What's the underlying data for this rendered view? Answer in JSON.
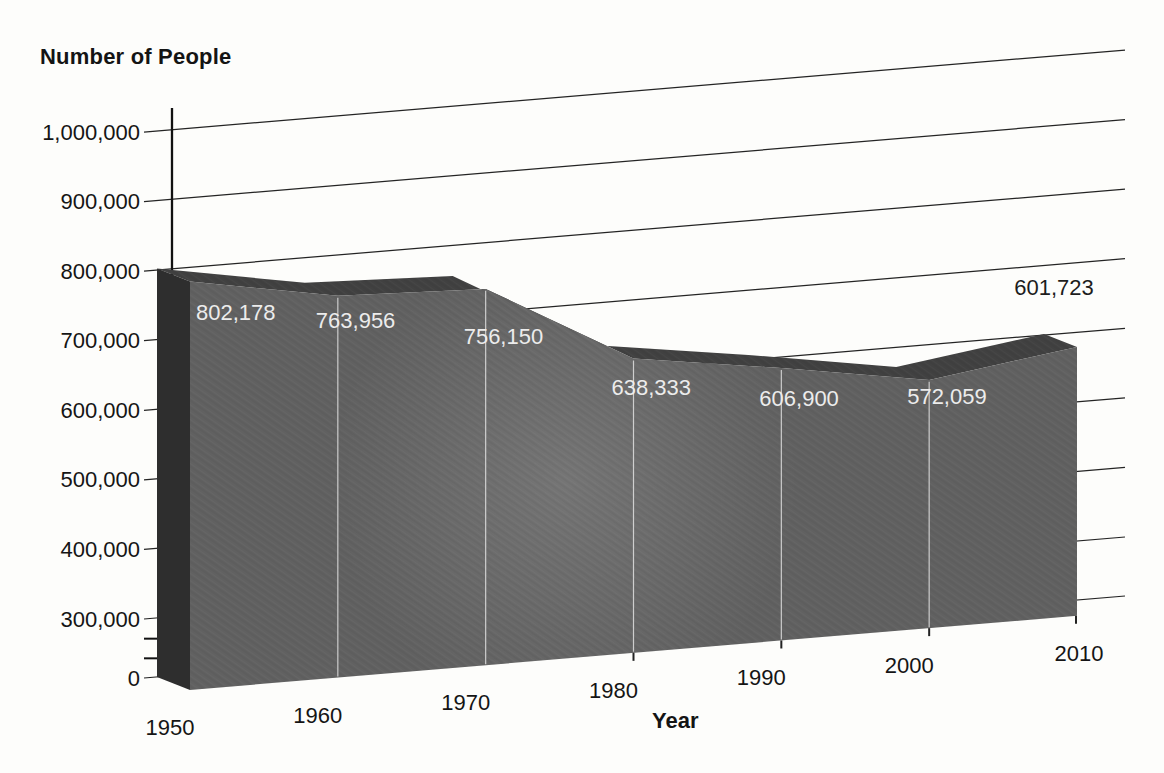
{
  "page": {
    "background": "#fdfdfb"
  },
  "chart_data": {
    "type": "area",
    "style": "3d-extruded-area-chart-with-slanted-backwall-grid",
    "title": "Number of People",
    "xlabel": "Year",
    "ylabel": "Number of People",
    "x": [
      1950,
      1960,
      1970,
      1980,
      1990,
      2000,
      2010
    ],
    "x_tick_labels": [
      "1950",
      "1960",
      "1970",
      "1980",
      "1990",
      "2000",
      "2010"
    ],
    "values": [
      802178,
      763956,
      756150,
      638333,
      606900,
      572059,
      601723
    ],
    "value_labels": [
      "802,178",
      "763,956",
      "756,150",
      "638,333",
      "606,900",
      "572,059",
      "601,723"
    ],
    "value_label_notes": {
      "labels_1950_to_2000": "printed in white on the dark area face",
      "label_2010": "printed in black above the area, top right"
    },
    "y_axis": {
      "tick_labels": [
        "1,000,000",
        "900,000",
        "800,000",
        "700,000",
        "600,000",
        "500,000",
        "400,000",
        "300,000",
        "0"
      ],
      "tick_values": [
        1000000,
        900000,
        800000,
        700000,
        600000,
        500000,
        400000,
        300000,
        0
      ],
      "minor_unlabeled_tick_values": [
        200000,
        100000
      ],
      "axis_break_between": [
        0,
        300000
      ],
      "ylim": [
        0,
        1000000
      ]
    },
    "grid": {
      "visible": true,
      "slanted": true,
      "lines_at": [
        1000000,
        900000,
        800000,
        700000,
        600000,
        500000,
        400000,
        300000,
        0
      ]
    },
    "colors": {
      "area_front": "#616161",
      "area_top": "#414141",
      "area_side": "#2e2e2e",
      "separator": "#e8e8e8",
      "grid": "#242424",
      "axis": "#111111",
      "text": "#151515",
      "value_label_on_area": "#ececec",
      "value_label_2010": "#1d1d1d"
    }
  }
}
